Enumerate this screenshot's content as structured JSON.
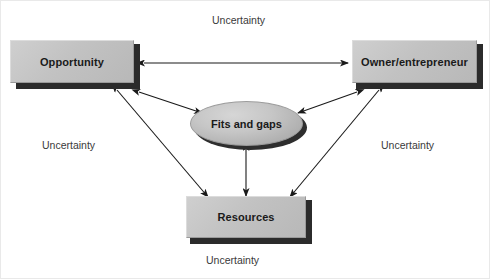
{
  "diagram": {
    "nodes": {
      "opportunity": {
        "label": "Opportunity",
        "shape": "box-3d"
      },
      "owner": {
        "label": "Owner/entrepreneur",
        "shape": "box-3d"
      },
      "resources": {
        "label": "Resources",
        "shape": "box-3d"
      },
      "center": {
        "label": "Fits and gaps",
        "shape": "ellipse-3d"
      }
    },
    "uncertainty_labels": [
      {
        "id": "uncertainty-top",
        "text": "Uncertainty"
      },
      {
        "id": "uncertainty-left",
        "text": "Uncertainty"
      },
      {
        "id": "uncertainty-right",
        "text": "Uncertainty"
      },
      {
        "id": "uncertainty-bottom",
        "text": "Uncertainty"
      }
    ],
    "connections": [
      {
        "id": "opportunity-owner",
        "from": "Opportunity",
        "to": "Owner/entrepreneur",
        "arrow": "double"
      },
      {
        "id": "opportunity-center",
        "from": "Opportunity",
        "to": "Fits and gaps",
        "arrow": "double"
      },
      {
        "id": "owner-center",
        "from": "Owner/entrepreneur",
        "to": "Fits and gaps",
        "arrow": "double"
      },
      {
        "id": "center-resources",
        "from": "Fits and gaps",
        "to": "Resources",
        "arrow": "double"
      },
      {
        "id": "opportunity-resources",
        "from": "Opportunity",
        "to": "Resources",
        "arrow": "double"
      },
      {
        "id": "owner-resources",
        "from": "Owner/entrepreneur",
        "to": "Resources",
        "arrow": "double"
      }
    ],
    "colors": {
      "node_fill": "#c4c4c4",
      "node_extrusion": "#2b2b2b",
      "arrow_stroke": "#1a1a1a",
      "label_text": "#3a3a3a",
      "background": "#ffffff"
    }
  }
}
